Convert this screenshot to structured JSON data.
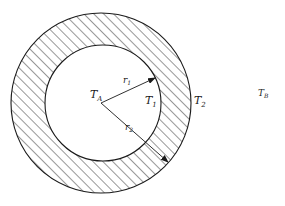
{
  "diagram": {
    "type": "cross-section of hollow cylinder / spherical shell",
    "labels": {
      "inner_temp": {
        "main": "T",
        "sub": "A"
      },
      "inner_radius": {
        "main": "r",
        "sub": "1"
      },
      "outer_radius": {
        "main": "r",
        "sub": "2"
      },
      "inner_surface_temp": {
        "main": "T",
        "sub": "1"
      },
      "outer_surface_temp": {
        "main": "T",
        "sub": "2"
      },
      "ambient_temp": {
        "main": "T",
        "sub": "B"
      }
    },
    "geometry": {
      "center": [
        101,
        103
      ],
      "inner_radius_px": 58,
      "outer_radius_px": 90,
      "hatch": "diagonal"
    },
    "colors": {
      "line": "#1a1a1a",
      "background": "#ffffff"
    }
  }
}
